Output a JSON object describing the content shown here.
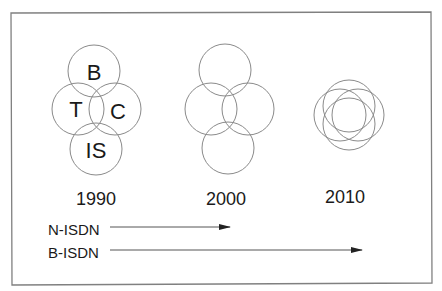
{
  "frame": {
    "border_color": "#808080"
  },
  "stages": [
    {
      "year": "1990",
      "circles": [
        {
          "label": "B",
          "cx": 94,
          "cy": 71,
          "r": 26
        },
        {
          "label": "T",
          "cx": 78,
          "cy": 109,
          "r": 26
        },
        {
          "label": "C",
          "cx": 115,
          "cy": 109,
          "r": 26
        },
        {
          "label": "IS",
          "cx": 96,
          "cy": 149,
          "r": 26
        }
      ],
      "year_x": 96,
      "year_y": 205
    },
    {
      "year": "2000",
      "circles": [
        {
          "label": "",
          "cx": 225,
          "cy": 70,
          "r": 26
        },
        {
          "label": "",
          "cx": 211,
          "cy": 109,
          "r": 26
        },
        {
          "label": "",
          "cx": 248,
          "cy": 109,
          "r": 26
        },
        {
          "label": "",
          "cx": 228,
          "cy": 148,
          "r": 26
        }
      ],
      "year_x": 226,
      "year_y": 205
    },
    {
      "year": "2010",
      "circles": [
        {
          "label": "",
          "cx": 349,
          "cy": 106,
          "r": 26
        },
        {
          "label": "",
          "cx": 340,
          "cy": 115,
          "r": 26
        },
        {
          "label": "",
          "cx": 358,
          "cy": 115,
          "r": 26
        },
        {
          "label": "",
          "cx": 349,
          "cy": 124,
          "r": 26
        }
      ],
      "year_x": 345,
      "year_y": 203
    }
  ],
  "timelines": [
    {
      "label": "N-ISDN",
      "y": 230,
      "line_y": 227,
      "x1": 110,
      "x2": 230
    },
    {
      "label": "B-ISDN",
      "y": 253,
      "line_y": 250,
      "x1": 110,
      "x2": 362
    }
  ],
  "colors": {
    "circle_stroke": "#8a8a8a",
    "text": "#1a1a1a",
    "arrow": "#222222"
  }
}
